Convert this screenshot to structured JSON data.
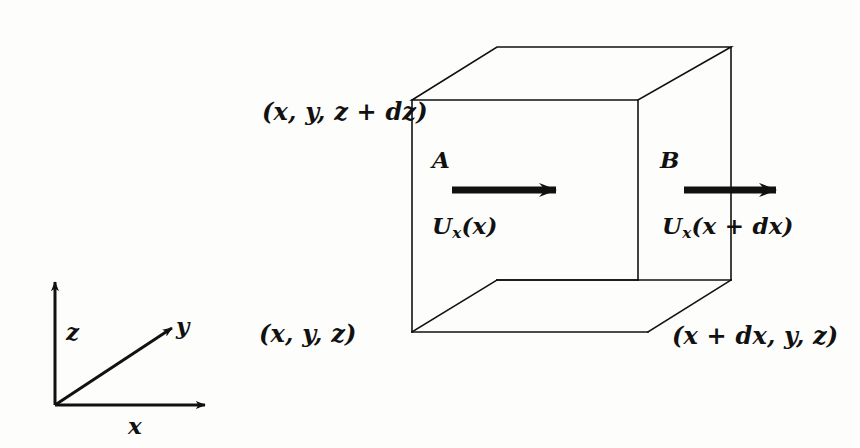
{
  "figure": {
    "background_color": "#fdfdfb",
    "ink_color": "#111111"
  },
  "box": {
    "description": "Rectangular control volume (cuboid) drawn in oblique projection",
    "faces": [
      {
        "id": "A",
        "label": "A",
        "position": "left (inlet) face at x",
        "velocity_label_prefix": "U",
        "velocity_subscript": "x",
        "velocity_argument": "(x)"
      },
      {
        "id": "B",
        "label": "B",
        "position": "right (outlet) face at x + dx",
        "velocity_label_prefix": "U",
        "velocity_subscript": "x",
        "velocity_argument": "(x + dx)"
      }
    ],
    "corner_labels": [
      {
        "id": "top-left",
        "text": "(x, y, z + dz)"
      },
      {
        "id": "bottom-right",
        "text": "(x + dx, y, z)"
      }
    ]
  },
  "origin_label": {
    "text": "(x, y, z)"
  },
  "axes": {
    "name": "coordinate-axes-triad",
    "items": [
      {
        "id": "z",
        "label": "z",
        "direction": "up"
      },
      {
        "id": "y",
        "label": "y",
        "direction": "diagonal-up-right"
      },
      {
        "id": "x",
        "label": "x",
        "direction": "right"
      }
    ]
  },
  "arrows": [
    {
      "id": "arrow-a",
      "meaning": "inflow velocity at face A",
      "direction": "right"
    },
    {
      "id": "arrow-b",
      "meaning": "outflow velocity at face B",
      "direction": "right"
    }
  ],
  "velocity_A": {
    "prefix": "U",
    "subscript": "x",
    "arg": "(x)"
  },
  "velocity_B": {
    "prefix": "U",
    "subscript": "x",
    "arg": "(x + dx)"
  },
  "face_A": {
    "label": "A"
  },
  "face_B": {
    "label": "B"
  }
}
